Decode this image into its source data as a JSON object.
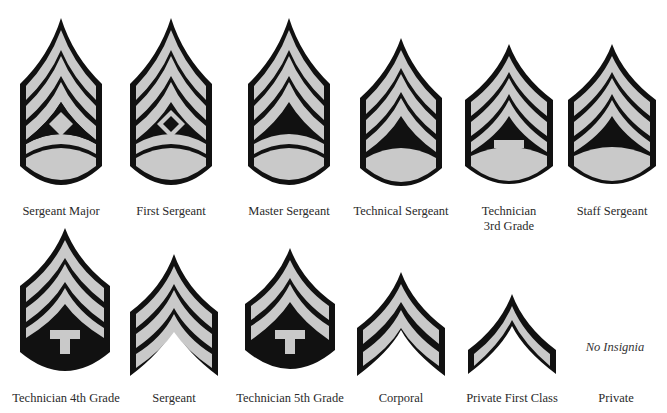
{
  "colors": {
    "stripe": "#c9c9c9",
    "outline": "#111111",
    "background": "#ffffff"
  },
  "insignia": [
    {
      "id": "sergeant-major",
      "label": "Sergeant Major",
      "upper": 3,
      "lower": 2,
      "device": "diamond-filled"
    },
    {
      "id": "first-sergeant",
      "label": "First Sergeant",
      "upper": 3,
      "lower": 2,
      "device": "diamond-outline"
    },
    {
      "id": "master-sergeant",
      "label": "Master Sergeant",
      "upper": 3,
      "lower": 2,
      "device": "none"
    },
    {
      "id": "technical-sergeant",
      "label": "Technical Sergeant",
      "upper": 3,
      "lower": 1,
      "device": "none"
    },
    {
      "id": "technician-3rd-grade",
      "label": "Technician 3rd Grade",
      "label_lines": [
        "Technician",
        "3rd Grade"
      ],
      "upper": 3,
      "lower": 1,
      "device": "T"
    },
    {
      "id": "staff-sergeant",
      "label": "Staff Sergeant",
      "upper": 3,
      "lower": 1,
      "device": "none"
    },
    {
      "id": "technician-4th-grade",
      "label": "Technician 4th Grade",
      "upper": 3,
      "lower": 0,
      "device": "T"
    },
    {
      "id": "sergeant",
      "label": "Sergeant",
      "upper": 3,
      "lower": 0,
      "device": "none"
    },
    {
      "id": "technician-5th-grade",
      "label": "Technician 5th Grade",
      "upper": 2,
      "lower": 0,
      "device": "T"
    },
    {
      "id": "corporal",
      "label": "Corporal",
      "upper": 2,
      "lower": 0,
      "device": "none"
    },
    {
      "id": "private-first-class",
      "label": "Private First Class",
      "upper": 1,
      "lower": 0,
      "device": "none"
    },
    {
      "id": "private",
      "label": "Private",
      "upper": 0,
      "lower": 0,
      "device": "none",
      "note": "No Insignia"
    }
  ]
}
